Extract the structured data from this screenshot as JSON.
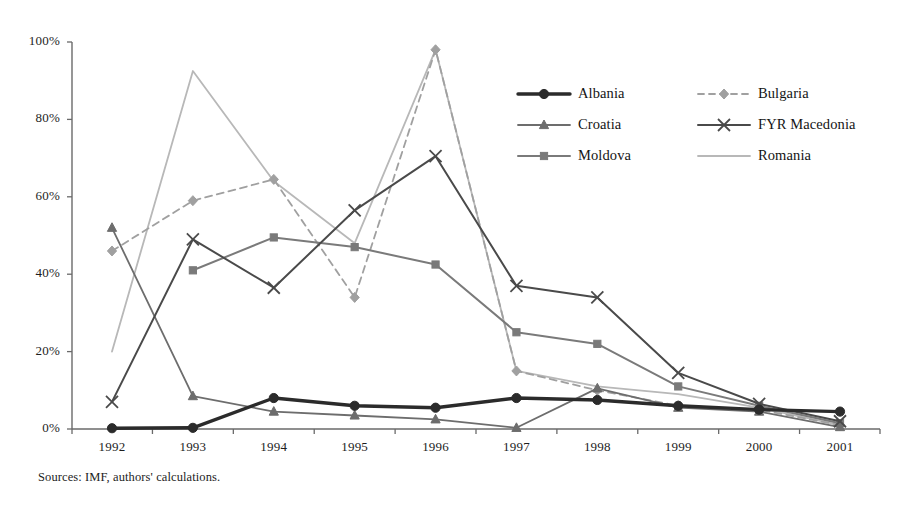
{
  "source_note": "Sources: IMF, authors' calculations.",
  "axis": {
    "y_ticks": [
      "0%",
      "20%",
      "40%",
      "60%",
      "80%",
      "100%"
    ],
    "x_ticks": [
      "1992",
      "1993",
      "1994",
      "1995",
      "1996",
      "1997",
      "1998",
      "1999",
      "2000",
      "2001"
    ]
  },
  "legend": {
    "entries": [
      {
        "label": "Albania",
        "color": "#2b2b2b",
        "marker": "circle",
        "dash": "none",
        "width": 3.4,
        "column": 0
      },
      {
        "label": "Bulgaria",
        "color": "#a0a0a0",
        "marker": "diamond",
        "dash": "dash",
        "width": 1.8,
        "column": 1
      },
      {
        "label": "Croatia",
        "color": "#6d6d6d",
        "marker": "triangle",
        "dash": "none",
        "width": 1.8,
        "column": 0
      },
      {
        "label": "FYR Macedonia",
        "color": "#4a4a4a",
        "marker": "cross",
        "dash": "none",
        "width": 2.0,
        "column": 1
      },
      {
        "label": "Moldova",
        "color": "#7a7a7a",
        "marker": "square",
        "dash": "none",
        "width": 2.0,
        "column": 0
      },
      {
        "label": "Romania",
        "color": "#b8b8b8",
        "marker": "none",
        "dash": "none",
        "width": 1.8,
        "column": 1
      }
    ]
  },
  "chart_data": {
    "type": "line",
    "title": "",
    "subtitle": "",
    "xlabel": "",
    "ylabel": "",
    "x": [
      1992,
      1993,
      1994,
      1995,
      1996,
      1997,
      1998,
      1999,
      2000,
      2001
    ],
    "categories": [
      "1992",
      "1993",
      "1994",
      "1995",
      "1996",
      "1997",
      "1998",
      "1999",
      "2000",
      "2001"
    ],
    "ylim": [
      0,
      100
    ],
    "yticks": [
      0,
      20,
      40,
      60,
      80,
      100
    ],
    "y_tick_format": "percent",
    "grid": false,
    "legend_position": "top-right-inside",
    "series": [
      {
        "name": "Albania",
        "color": "#2b2b2b",
        "marker": "circle",
        "dash": "none",
        "width": 3.4,
        "values": [
          0.2,
          0.3,
          8.0,
          6.0,
          5.5,
          8.0,
          7.5,
          6.0,
          5.0,
          4.5
        ]
      },
      {
        "name": "Bulgaria",
        "color": "#a0a0a0",
        "marker": "diamond",
        "dash": "dash",
        "width": 1.8,
        "values": [
          46.0,
          59.0,
          64.5,
          34.0,
          98.0,
          15.0,
          10.0,
          6.0,
          5.0,
          1.0
        ]
      },
      {
        "name": "Croatia",
        "color": "#6d6d6d",
        "marker": "triangle",
        "dash": "none",
        "width": 1.8,
        "values": [
          52.0,
          8.5,
          4.5,
          3.5,
          2.5,
          0.3,
          10.5,
          5.5,
          4.5,
          0.5
        ]
      },
      {
        "name": "FYR Macedonia",
        "color": "#4a4a4a",
        "marker": "cross",
        "dash": "none",
        "width": 2.0,
        "values": [
          7.0,
          49.0,
          36.5,
          56.5,
          70.5,
          37.0,
          34.0,
          14.5,
          6.5,
          2.0
        ]
      },
      {
        "name": "Moldova",
        "color": "#7a7a7a",
        "marker": "square",
        "dash": "none",
        "width": 2.0,
        "values": [
          null,
          41.0,
          49.5,
          47.0,
          42.5,
          25.0,
          22.0,
          11.0,
          6.0,
          1.5
        ]
      },
      {
        "name": "Romania",
        "color": "#b8b8b8",
        "marker": "none",
        "dash": "none",
        "width": 1.8,
        "values": [
          20.0,
          92.5,
          64.0,
          48.0,
          98.0,
          15.0,
          11.0,
          9.0,
          5.5,
          1.0
        ]
      }
    ]
  }
}
